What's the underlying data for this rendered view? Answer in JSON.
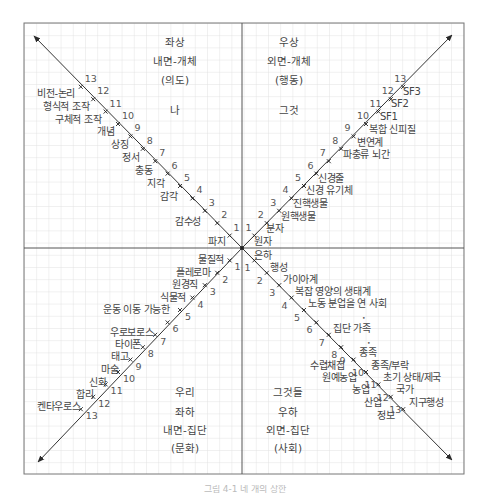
{
  "quadrants": {
    "upper_left": {
      "position": "좌상",
      "domain": "내면-개체",
      "aspect": "(의도)",
      "pronoun": "나"
    },
    "upper_right": {
      "position": "우상",
      "domain": "외면-개체",
      "aspect": "(행동)",
      "pronoun": "그것"
    },
    "lower_left": {
      "pronoun": "우리",
      "position": "좌하",
      "domain": "내면-집단",
      "aspect": "(문화)"
    },
    "lower_right": {
      "pronoun": "그것들",
      "position": "우하",
      "domain": "외면-집단",
      "aspect": "(사회)"
    }
  },
  "axes": {
    "upper_left": {
      "origin_label": "파지",
      "items": [
        "감수성",
        "감각",
        "지각",
        "충동",
        "정서",
        "상징",
        "개념",
        "구체적 조작",
        "형식적 조작",
        "비전-논리",
        "",
        "",
        ""
      ],
      "labels": [
        {
          "n": 2,
          "text": "감수성"
        },
        {
          "n": 4,
          "text": "감각"
        },
        {
          "n": 5,
          "text": "지각"
        },
        {
          "n": 6,
          "text": "충동"
        },
        {
          "n": 7,
          "text": "정서"
        },
        {
          "n": 8,
          "text": "상징"
        },
        {
          "n": 9,
          "text": "개념"
        },
        {
          "n": 10,
          "text": "구체적 조작"
        },
        {
          "n": 11,
          "text": "형식적 조작"
        },
        {
          "n": 12,
          "text": "비전-논리"
        }
      ]
    },
    "upper_right": {
      "origin_label": "원자",
      "labels": [
        {
          "n": 1,
          "text": "분자"
        },
        {
          "n": 2,
          "text": "원핵생물"
        },
        {
          "n": 3,
          "text": "진핵생물"
        },
        {
          "n": 4,
          "text": "신경 유기체"
        },
        {
          "n": 5,
          "text": "신경줄"
        },
        {
          "n": 7,
          "text": "파충류 뇌간"
        },
        {
          "n": 8,
          "text": "변연계"
        },
        {
          "n": 9,
          "text": "복합 신피질"
        },
        {
          "n": 10,
          "text": "SF1"
        },
        {
          "n": 11,
          "text": "SF2"
        },
        {
          "n": 12,
          "text": "SF3"
        }
      ]
    },
    "lower_left": {
      "labels": [
        {
          "n": 1,
          "text": "물질적"
        },
        {
          "n": 2,
          "text": "플레로마"
        },
        {
          "n": 3,
          "text": "원경직"
        },
        {
          "n": 4,
          "text": "식물적"
        },
        {
          "n": 5,
          "text": "운동 이동 가능한"
        },
        {
          "n": 6,
          "text": "우로보로스"
        },
        {
          "n": 7,
          "text": "타이폰"
        },
        {
          "n": 8,
          "text": "태고"
        },
        {
          "n": 9,
          "text": "마술"
        },
        {
          "n": 10,
          "text": "신화"
        },
        {
          "n": 11,
          "text": "합리"
        },
        {
          "n": 12,
          "text": "켄타우로스"
        }
      ]
    },
    "lower_right": {
      "origin_label": "은하",
      "labels": [
        {
          "n": 1,
          "text": "행성"
        },
        {
          "n": 2,
          "text": "가이아계"
        },
        {
          "n": 3,
          "text": "복잡 영양의 생태계"
        },
        {
          "n": 4,
          "text": "노동 분업을 연 사회"
        },
        {
          "n": 6,
          "text": "집단 가족"
        },
        {
          "n": 8,
          "text": "종족"
        },
        {
          "n": 9,
          "text": "종족/부락"
        },
        {
          "n": 10,
          "text": "초기 상태/제국"
        },
        {
          "n": 11,
          "text": "국가"
        },
        {
          "n": 12,
          "text": "지구행성"
        }
      ],
      "left_labels": [
        {
          "n": 9,
          "text": "수렵채집"
        },
        {
          "n": 10,
          "text": "원예농업"
        },
        {
          "n": 11,
          "text": "농업"
        },
        {
          "n": 12,
          "text": "산업"
        },
        {
          "n": 13,
          "text": "정보"
        }
      ]
    }
  },
  "tick_numbers": [
    "1",
    "2",
    "3",
    "4",
    "5",
    "6",
    "7",
    "8",
    "9",
    "10",
    "11",
    "12",
    "13"
  ],
  "caption": "그림 4-1 네 개의 상한",
  "colors": {
    "grid": "#d9d9d9",
    "frame": "#6b6b6b",
    "axis": "#333333",
    "text": "#444444"
  }
}
